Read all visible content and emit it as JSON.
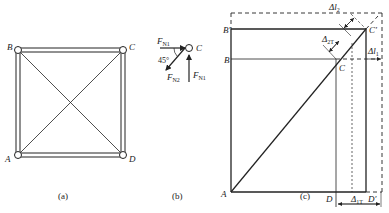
{
  "figure_a": {
    "caption": "(a)",
    "nodes": {
      "A": "A",
      "B": "B",
      "C": "C",
      "D": "D"
    }
  },
  "figure_b": {
    "caption": "(b)",
    "node": "C",
    "forces": {
      "fn1_left": "F",
      "fn1_left_sub": "N1",
      "fn2": "F",
      "fn2_sub": "N2",
      "fn1_up": "F",
      "fn1_up_sub": "N1"
    },
    "angle": "45°"
  },
  "figure_c": {
    "caption": "(c)",
    "labels": {
      "A": "A",
      "B": "B",
      "B_prime": "B′",
      "C": "C",
      "C_prime": "C′",
      "D": "D",
      "D_prime": "D′",
      "dl2": "Δl",
      "dl2_sub": "2",
      "d2T": "Δ",
      "d2T_sub": "2T",
      "dl1": "Δl",
      "dl1_sub": "1",
      "d1T": "Δ",
      "d1T_sub": "1T"
    }
  },
  "colors": {
    "line": "#222222",
    "background": "#ffffff"
  }
}
